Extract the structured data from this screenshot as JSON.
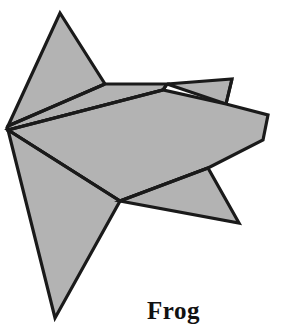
{
  "figure": {
    "caption": "Frog",
    "kind": "origami-fold-diagram",
    "colors": {
      "paper_fill": "#b3b3b3",
      "outline": "#1a1a1a",
      "background": "#ffffff",
      "caption_color": "#111111"
    },
    "canvas": {
      "width": 285,
      "height": 334
    },
    "shapes": [
      {
        "name": "upper-left-flap",
        "points": "60,13 105,84 46,110 8,126"
      },
      {
        "name": "upper-sliver-band",
        "points": "8,126 105,84 167,84 163,90 8,130"
      },
      {
        "name": "top-right-small-flap",
        "points": "167,84 232,79 226,104"
      },
      {
        "name": "main-body",
        "points": "8,130 163,90 226,104 268,115 263,140 208,168 120,201"
      },
      {
        "name": "lower-left-leg",
        "points": "8,130 120,201 55,318"
      },
      {
        "name": "lower-right-leg",
        "points": "120,201 208,168 239,223"
      }
    ],
    "creases": [
      {
        "name": "crease-left-to-upper-flap",
        "d": "M 8,126 L 105,84"
      },
      {
        "name": "crease-left-to-body-top",
        "d": "M 8,130 L 163,90"
      },
      {
        "name": "crease-left-to-knee",
        "d": "M 8,130 L 120,201"
      },
      {
        "name": "crease-body-top-to-pinch",
        "d": "M 163,90 L 167,84"
      },
      {
        "name": "crease-knee-to-hip",
        "d": "M 120,201 L 208,168"
      },
      {
        "name": "crease-notch",
        "d": "M 226,104 L 232,79"
      }
    ]
  }
}
